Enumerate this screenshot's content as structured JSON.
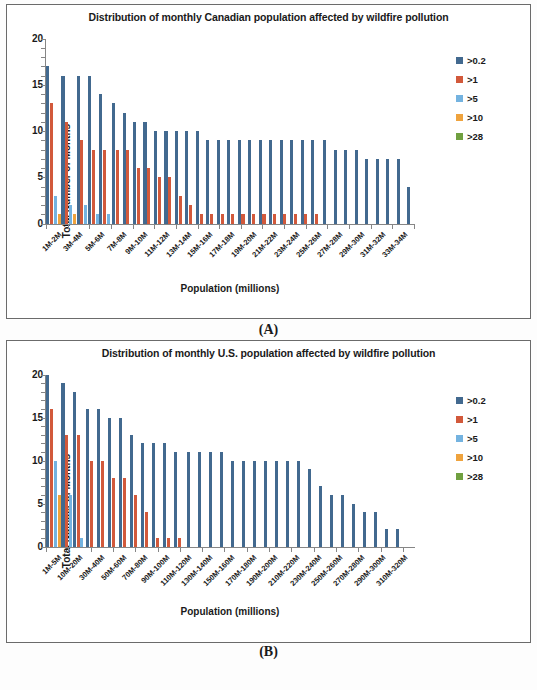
{
  "figure": {
    "panels": [
      {
        "caption": "(A)"
      },
      {
        "caption": "(B)"
      }
    ]
  },
  "chart_data": [
    {
      "type": "bar",
      "panel": "A",
      "title": "Distribution of monthly Canadian population affected by wildfire pollution",
      "xlabel": "Population (millions)",
      "ylabel": "Total Number of Months",
      "ylim": [
        0,
        20
      ],
      "yticks": [
        0,
        5,
        10,
        15,
        20
      ],
      "grid": false,
      "legend_position": "right",
      "bar_style": "clustered",
      "categories": [
        "1M-2M",
        "2M-3M",
        "3M-4M",
        "4M-5M",
        "5M-6M",
        "6M-7M",
        "7M-8M",
        "8M-9M",
        "9M-10M",
        "10M-11M",
        "11M-12M",
        "12M-13M",
        "13M-14M",
        "14M-15M",
        "15M-16M",
        "16M-17M",
        "17M-18M",
        "18M-19M",
        "19M-20M",
        "20M-21M",
        "21M-22M",
        "22M-23M",
        "23M-24M",
        "24M-25M",
        "25M-26M",
        "26M-27M",
        "27M-28M",
        "28M-29M",
        "29M-30M",
        "30M-31M",
        "31M-32M",
        "32M-33M",
        "33M-34M",
        "34M-35M"
      ],
      "tick_labels": [
        "1M-2M",
        "3M-4M",
        "5M-6M",
        "7M-8M",
        "9M-10M",
        "11M-12M",
        "13M-14M",
        "15M-16M",
        "17M-18M",
        "19M-20M",
        "21M-22M",
        "23M-24M",
        "25M-26M",
        "27M-28M",
        "29M-30M",
        "31M-32M",
        "33M-34M"
      ],
      "series": [
        {
          "name": ">0.2",
          "color": "#42698F",
          "values": [
            17,
            16,
            16,
            16,
            14,
            13,
            12,
            11,
            11,
            10,
            10,
            10,
            10,
            10,
            9,
            9,
            9,
            9,
            9,
            9,
            9,
            9,
            9,
            9,
            9,
            9,
            8,
            8,
            8,
            7,
            7,
            7,
            7,
            4
          ]
        },
        {
          "name": ">1",
          "color": "#D2593B",
          "values": [
            13,
            11,
            9,
            8,
            8,
            8,
            8,
            6,
            6,
            5,
            5,
            3,
            2,
            1,
            1,
            1,
            1,
            1,
            1,
            1,
            1,
            1,
            1,
            1,
            1,
            0,
            0,
            0,
            0,
            0,
            0,
            0,
            0,
            0
          ]
        },
        {
          "name": ">5",
          "color": "#74B3E0",
          "values": [
            3,
            2,
            2,
            1,
            1,
            0,
            0,
            0,
            0,
            0,
            0,
            0,
            0,
            0,
            0,
            0,
            0,
            0,
            0,
            0,
            0,
            0,
            0,
            0,
            0,
            0,
            0,
            0,
            0,
            0,
            0,
            0,
            0,
            0
          ]
        },
        {
          "name": ">10",
          "color": "#EFA33D",
          "values": [
            1,
            1,
            0,
            0,
            0,
            0,
            0,
            0,
            0,
            0,
            0,
            0,
            0,
            0,
            0,
            0,
            0,
            0,
            0,
            0,
            0,
            0,
            0,
            0,
            0,
            0,
            0,
            0,
            0,
            0,
            0,
            0,
            0,
            0
          ]
        },
        {
          "name": ">28",
          "color": "#70A040",
          "values": [
            0,
            0,
            0,
            0,
            0,
            0,
            0,
            0,
            0,
            0,
            0,
            0,
            0,
            0,
            0,
            0,
            0,
            0,
            0,
            0,
            0,
            0,
            0,
            0,
            0,
            0,
            0,
            0,
            0,
            0,
            0,
            0,
            0,
            0
          ]
        }
      ]
    },
    {
      "type": "bar",
      "panel": "B",
      "title": "Distribution of monthly U.S. population affected by wildfire pollution",
      "xlabel": "Population (millions)",
      "ylabel": "Total Number of Months",
      "ylim": [
        0,
        20
      ],
      "yticks": [
        0,
        5,
        10,
        15,
        20
      ],
      "grid": false,
      "legend_position": "right",
      "bar_style": "clustered",
      "categories": [
        "1M-5M",
        "5M-10M",
        "10M-20M",
        "20M-30M",
        "30M-40M",
        "40M-50M",
        "50M-60M",
        "60M-70M",
        "70M-80M",
        "80M-90M",
        "90M-100M",
        "100M-110M",
        "110M-120M",
        "120M-130M",
        "130M-140M",
        "140M-150M",
        "150M-160M",
        "160M-170M",
        "170M-180M",
        "180M-190M",
        "190M-200M",
        "200M-210M",
        "210M-220M",
        "220M-230M",
        "230M-240M",
        "240M-250M",
        "250M-260M",
        "260M-270M",
        "270M-280M",
        "280M-290M",
        "290M-300M",
        "300M-310M",
        "310M-320M"
      ],
      "tick_labels": [
        "1M-5M",
        "10M-20M",
        "30M-40M",
        "50M-60M",
        "70M-80M",
        "90M-100M",
        "110M-120M",
        "130M-140M",
        "150M-160M",
        "170M-180M",
        "190M-200M",
        "210M-220M",
        "230M-240M",
        "250M-260M",
        "270M-280M",
        "290M-300M",
        "310M-320M"
      ],
      "series": [
        {
          "name": ">0.2",
          "color": "#42698F",
          "values": [
            20,
            19,
            18,
            16,
            16,
            15,
            15,
            13,
            12,
            12,
            12,
            11,
            11,
            11,
            11,
            11,
            10,
            10,
            10,
            10,
            10,
            10,
            10,
            9,
            7,
            6,
            6,
            5,
            4,
            4,
            2,
            2,
            0
          ]
        },
        {
          "name": ">1",
          "color": "#D2593B",
          "values": [
            16,
            13,
            13,
            10,
            10,
            8,
            8,
            6,
            4,
            1,
            1,
            1,
            0,
            0,
            0,
            0,
            0,
            0,
            0,
            0,
            0,
            0,
            0,
            0,
            0,
            0,
            0,
            0,
            0,
            0,
            0,
            0,
            0
          ]
        },
        {
          "name": ">5",
          "color": "#74B3E0",
          "values": [
            10,
            6,
            1,
            0,
            0,
            0,
            0,
            0,
            0,
            0,
            0,
            0,
            0,
            0,
            0,
            0,
            0,
            0,
            0,
            0,
            0,
            0,
            0,
            0,
            0,
            0,
            0,
            0,
            0,
            0,
            0,
            0,
            0
          ]
        },
        {
          "name": ">10",
          "color": "#EFA33D",
          "values": [
            6,
            0,
            0,
            0,
            0,
            0,
            0,
            0,
            0,
            0,
            0,
            0,
            0,
            0,
            0,
            0,
            0,
            0,
            0,
            0,
            0,
            0,
            0,
            0,
            0,
            0,
            0,
            0,
            0,
            0,
            0,
            0,
            0
          ]
        },
        {
          "name": ">28",
          "color": "#70A040",
          "values": [
            0,
            0,
            0,
            0,
            0,
            0,
            0,
            0,
            0,
            0,
            0,
            0,
            0,
            0,
            0,
            0,
            0,
            0,
            0,
            0,
            0,
            0,
            0,
            0,
            0,
            0,
            0,
            0,
            0,
            0,
            0,
            0,
            0
          ]
        }
      ]
    }
  ]
}
